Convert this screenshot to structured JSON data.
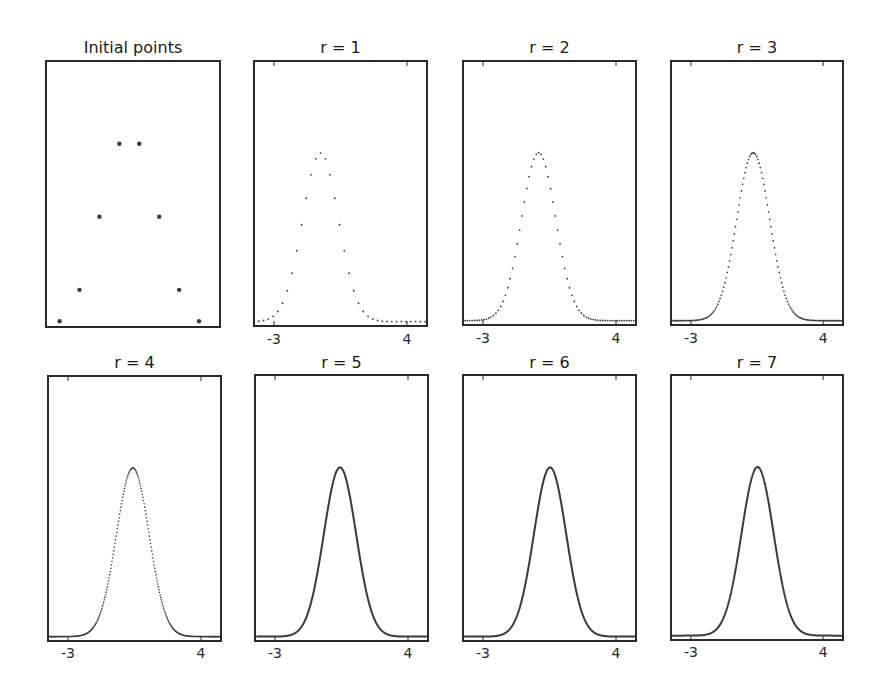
{
  "figure": {
    "background": "#ffffff",
    "frame_color": "#2a2a2a",
    "marker_color": "#3a3a3a"
  },
  "chart_data": [
    {
      "type": "scatter",
      "title": "Initial points",
      "xlabel": "",
      "ylabel": "",
      "xlim": [
        -3.63,
        5.0
      ],
      "ylim": [
        -0.065,
        3.55
      ],
      "xticks": [],
      "grid": false,
      "render": "dots",
      "marker_size": 2.2,
      "x": [
        -3,
        -2,
        -1,
        0,
        1,
        2,
        3,
        4
      ],
      "y": [
        0,
        0.43,
        1.43,
        2.43,
        2.43,
        1.43,
        0.43,
        0
      ]
    },
    {
      "type": "scatter",
      "title": "r = 1",
      "xlabel": "",
      "ylabel": "",
      "xlim": [
        -4,
        5
      ],
      "ylim": [
        -0.02,
        1.54
      ],
      "xticks": [
        -3,
        4
      ],
      "xtick_labels": [
        "-3",
        "4"
      ],
      "grid": false,
      "render": "dots",
      "marker_size": 0.9,
      "center": -0.55,
      "sigma": 0.95,
      "peak": 1.0,
      "x_spacing": 0.25,
      "sampled_x": [
        -4,
        -3,
        -2,
        -1,
        -0.55,
        0,
        1,
        2,
        3,
        4,
        5
      ],
      "sampled_y": [
        0.0,
        0.01,
        0.11,
        0.63,
        1.0,
        0.85,
        0.1,
        0.0,
        0.0,
        0.0,
        0.0
      ]
    },
    {
      "type": "scatter",
      "title": "r = 2",
      "xlabel": "",
      "ylabel": "",
      "xlim": [
        -4,
        5
      ],
      "ylim": [
        -0.02,
        1.54
      ],
      "xticks": [
        -3,
        4
      ],
      "xtick_labels": [
        "-3",
        "4"
      ],
      "grid": false,
      "render": "dots",
      "marker_size": 0.9,
      "center": -0.07,
      "sigma": 0.9,
      "peak": 1.0,
      "x_spacing": 0.125,
      "sampled_x": [
        -4,
        -3,
        -2,
        -1,
        -0.07,
        1,
        2,
        3,
        4,
        5
      ],
      "sampled_y": [
        0.0,
        0.0,
        0.03,
        0.35,
        1.0,
        0.3,
        0.02,
        0.0,
        0.0,
        0.0
      ]
    },
    {
      "type": "scatter",
      "title": "r = 3",
      "xlabel": "",
      "ylabel": "",
      "xlim": [
        -4,
        5
      ],
      "ylim": [
        -0.02,
        1.54
      ],
      "xticks": [
        -3,
        4
      ],
      "xtick_labels": [
        "-3",
        "4"
      ],
      "grid": false,
      "render": "dots",
      "marker_size": 0.85,
      "center": 0.3,
      "sigma": 0.87,
      "peak": 1.0,
      "x_spacing": 0.0625,
      "sampled_x": [
        -4,
        -3,
        -2,
        -1,
        0.3,
        1,
        2,
        3,
        4,
        5
      ],
      "sampled_y": [
        0.0,
        0.0,
        0.01,
        0.33,
        1.0,
        0.72,
        0.15,
        0.01,
        0.0,
        0.0
      ]
    },
    {
      "type": "scatter",
      "title": "r = 4",
      "xlabel": "",
      "ylabel": "",
      "xlim": [
        -4,
        5
      ],
      "ylim": [
        -0.02,
        1.54
      ],
      "xticks": [
        -3,
        4
      ],
      "xtick_labels": [
        "-3",
        "4"
      ],
      "grid": false,
      "render": "dots",
      "marker_size": 0.8,
      "center": 0.41,
      "sigma": 0.86,
      "peak": 1.0,
      "x_spacing": 0.03125,
      "sampled_x": [
        -4,
        -3,
        -2,
        -1,
        0.41,
        1,
        2,
        3,
        4,
        5
      ],
      "sampled_y": [
        0.0,
        0.0,
        0.0,
        0.25,
        1.0,
        0.79,
        0.18,
        0.01,
        0.0,
        0.0
      ]
    },
    {
      "type": "line",
      "title": "r = 5",
      "xlabel": "",
      "ylabel": "",
      "xlim": [
        -4,
        5
      ],
      "ylim": [
        -0.02,
        1.54
      ],
      "xticks": [
        -3,
        4
      ],
      "xtick_labels": [
        "-3",
        "4"
      ],
      "grid": false,
      "render": "line",
      "line_width": 2,
      "center": 0.42,
      "sigma": 0.85,
      "peak": 1.0,
      "x_spacing": 0.015625,
      "sampled_x": [
        -4,
        -3,
        -2,
        -1,
        0.42,
        1,
        2,
        3,
        4,
        5
      ],
      "sampled_y": [
        0.0,
        0.0,
        0.0,
        0.24,
        1.0,
        0.79,
        0.18,
        0.01,
        0.0,
        0.0
      ]
    },
    {
      "type": "line",
      "title": "r = 6",
      "xlabel": "",
      "ylabel": "",
      "xlim": [
        -4,
        5
      ],
      "ylim": [
        -0.02,
        1.54
      ],
      "xticks": [
        -3,
        4
      ],
      "xtick_labels": [
        "-3",
        "4"
      ],
      "grid": false,
      "render": "line",
      "line_width": 2,
      "center": 0.53,
      "sigma": 0.85,
      "peak": 1.0,
      "x_spacing": 0.0078125,
      "sampled_x": [
        -4,
        -3,
        -2,
        -1,
        0.53,
        1,
        2,
        3,
        4,
        5
      ],
      "sampled_y": [
        0.0,
        0.0,
        0.0,
        0.2,
        1.0,
        0.86,
        0.22,
        0.02,
        0.0,
        0.0
      ]
    },
    {
      "type": "line",
      "title": "r = 7",
      "xlabel": "",
      "ylabel": "",
      "xlim": [
        -4,
        5
      ],
      "ylim": [
        -0.02,
        1.54
      ],
      "xticks": [
        -3,
        4
      ],
      "xtick_labels": [
        "-3",
        "4"
      ],
      "grid": false,
      "render": "line",
      "line_width": 2,
      "center": 0.53,
      "sigma": 0.85,
      "peak": 1.0,
      "x_spacing": 0.00390625,
      "sampled_x": [
        -4,
        -3,
        -2,
        -1,
        0.53,
        1,
        2,
        3,
        4,
        5
      ],
      "sampled_y": [
        0.0,
        0.0,
        0.0,
        0.2,
        1.0,
        0.86,
        0.22,
        0.02,
        0.0,
        0.0
      ]
    }
  ],
  "panels": [
    {
      "title": "Initial points"
    },
    {
      "title": "r = 1",
      "ticks": [
        "-3",
        "4"
      ]
    },
    {
      "title": "r = 2",
      "ticks": [
        "-3",
        "4"
      ]
    },
    {
      "title": "r = 3",
      "ticks": [
        "-3",
        "4"
      ]
    },
    {
      "title": "r = 4",
      "ticks": [
        "-3",
        "4"
      ]
    },
    {
      "title": "r = 5",
      "ticks": [
        "-3",
        "4"
      ]
    },
    {
      "title": "r = 6",
      "ticks": [
        "-3",
        "4"
      ]
    },
    {
      "title": "r = 7",
      "ticks": [
        "-3",
        "4"
      ]
    }
  ]
}
